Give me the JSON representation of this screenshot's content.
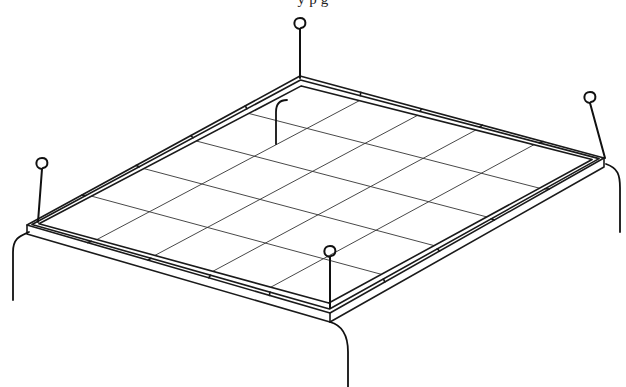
{
  "figure": {
    "caption_fragment": "y   p       g",
    "grid": {
      "divisions_a": 5,
      "divisions_b": 5
    },
    "corners": {
      "left": [
        27,
        225
      ],
      "back": [
        300,
        76
      ],
      "right": [
        604,
        158
      ],
      "front": [
        330,
        313
      ]
    },
    "pins": [
      {
        "name": "left-pin",
        "base": [
          38,
          222
        ],
        "hook_top": [
          42,
          158
        ]
      },
      {
        "name": "back-pin",
        "base": [
          300,
          78
        ],
        "hook_top": [
          300,
          18
        ]
      },
      {
        "name": "right-pin",
        "base": [
          605,
          158
        ],
        "hook_top": [
          590,
          92
        ]
      },
      {
        "name": "front-pin",
        "base": [
          330,
          308
        ],
        "hook_top": [
          330,
          246
        ]
      }
    ],
    "colors": {
      "line": "#1a1a1a",
      "background": "#ffffff"
    }
  }
}
